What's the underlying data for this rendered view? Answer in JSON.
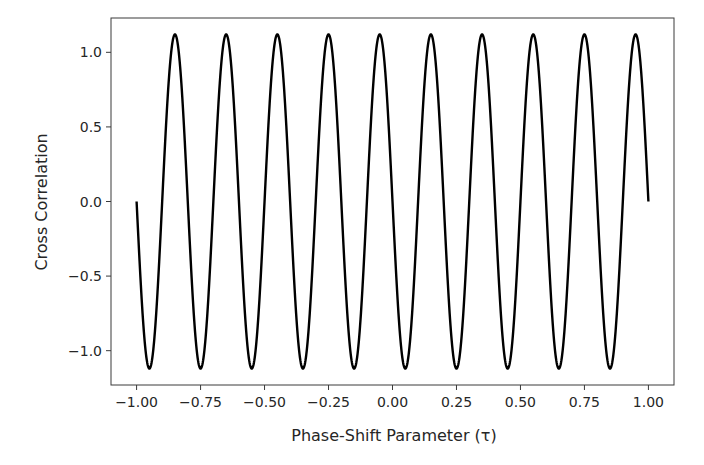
{
  "chart_data": {
    "type": "line",
    "title": "",
    "xlabel": "Phase-Shift Parameter (τ)",
    "ylabel": "Cross Correlation",
    "xlim": [
      -1.1,
      1.1
    ],
    "ylim": [
      -1.23,
      1.23
    ],
    "grid": false,
    "legend": null,
    "x_ticks": [
      -1.0,
      -0.75,
      -0.5,
      -0.25,
      0.0,
      0.25,
      0.5,
      0.75,
      1.0
    ],
    "x_tick_labels": [
      "−1.00",
      "−0.75",
      "−0.50",
      "−0.25",
      "0.00",
      "0.25",
      "0.50",
      "0.75",
      "1.00"
    ],
    "y_ticks": [
      -1.0,
      -0.5,
      0.0,
      0.5,
      1.0
    ],
    "y_tick_labels": [
      "−1.0",
      "−0.5",
      "0.0",
      "0.5",
      "1.0"
    ],
    "series": [
      {
        "name": "cross-correlation",
        "color": "#000000",
        "description": "y = -1.12 * sin(10*pi*(tau+1)), tau in [-1, 1]; 10 full periods, amplitude ~1.12",
        "x": [
          -1.0,
          -0.95,
          -0.9,
          -0.85,
          -0.8,
          -0.75,
          -0.7,
          -0.65,
          -0.6,
          -0.55,
          -0.5,
          -0.45,
          -0.4,
          -0.35,
          -0.3,
          -0.25,
          -0.2,
          -0.15,
          -0.1,
          -0.05,
          0.0,
          0.05,
          0.1,
          0.15,
          0.2,
          0.25,
          0.3,
          0.35,
          0.4,
          0.45,
          0.5,
          0.55,
          0.6,
          0.65,
          0.7,
          0.75,
          0.8,
          0.85,
          0.9,
          0.95,
          1.0
        ],
        "values": [
          0.0,
          -1.12,
          0.0,
          1.12,
          0.0,
          -1.12,
          0.0,
          1.12,
          0.0,
          -1.12,
          0.0,
          1.12,
          0.0,
          -1.12,
          0.0,
          1.12,
          0.0,
          -1.12,
          0.0,
          1.12,
          0.0,
          -1.12,
          0.0,
          1.12,
          0.0,
          -1.12,
          0.0,
          1.12,
          0.0,
          -1.12,
          0.0,
          1.12,
          0.0,
          -1.12,
          0.0,
          1.12,
          0.0,
          -1.12,
          0.0,
          1.12,
          0.0
        ],
        "amplitude": 1.12,
        "periods": 10
      }
    ]
  }
}
